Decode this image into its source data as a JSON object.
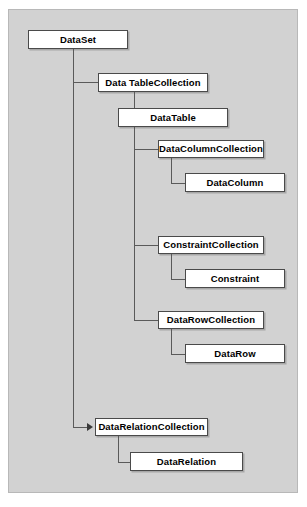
{
  "diagram": {
    "background_color": "#d2d2d2",
    "node_fill": "#ffffff",
    "node_border": "#4a4a4a",
    "connector_color": "#5a5a5a",
    "nodes": [
      {
        "id": "dataset",
        "label": "DataSet",
        "x": 28,
        "y": 30,
        "w": 100,
        "h": 19
      },
      {
        "id": "datatablecollection",
        "label": "Data TableCollection",
        "x": 98,
        "y": 73,
        "w": 110,
        "h": 19
      },
      {
        "id": "datatable",
        "label": "DataTable",
        "x": 118,
        "y": 108,
        "w": 110,
        "h": 19
      },
      {
        "id": "datacolumncollection",
        "label": "DataColumnCollection",
        "x": 158,
        "y": 140,
        "w": 106,
        "h": 18
      },
      {
        "id": "datacolumn",
        "label": "DataColumn",
        "x": 185,
        "y": 173,
        "w": 100,
        "h": 19
      },
      {
        "id": "constraintcollection",
        "label": "ConstraintCollection",
        "x": 158,
        "y": 236,
        "w": 106,
        "h": 18
      },
      {
        "id": "constraint",
        "label": "Constraint",
        "x": 185,
        "y": 269,
        "w": 100,
        "h": 19
      },
      {
        "id": "datarowcollection",
        "label": "DataRowCollection",
        "x": 158,
        "y": 311,
        "w": 106,
        "h": 18
      },
      {
        "id": "datarow",
        "label": "DataRow",
        "x": 185,
        "y": 344,
        "w": 100,
        "h": 19
      },
      {
        "id": "datarelationcollection",
        "label": "DataRelationCollection",
        "x": 95,
        "y": 418,
        "w": 113,
        "h": 18
      },
      {
        "id": "datarelation",
        "label": "DataRelation",
        "x": 130,
        "y": 452,
        "w": 113,
        "h": 19
      }
    ],
    "connectors": [
      {
        "id": "trunk-dataset",
        "type": "v",
        "x": 73,
        "y": 49,
        "len": 379
      },
      {
        "id": "dataset-to-dtc",
        "type": "h",
        "x": 73,
        "y": 82,
        "len": 25
      },
      {
        "id": "dataset-to-drc",
        "type": "h",
        "x": 73,
        "y": 427,
        "len": 15
      },
      {
        "id": "trunk-datatable",
        "type": "v",
        "x": 134,
        "y": 92,
        "len": 229
      },
      {
        "id": "dtc-to-dt",
        "type": "h",
        "x": 134,
        "y": 117,
        "len": 18
      },
      {
        "id": "dt-to-dcc",
        "type": "h",
        "x": 134,
        "y": 149,
        "len": 24
      },
      {
        "id": "dt-to-cc",
        "type": "h",
        "x": 134,
        "y": 245,
        "len": 24
      },
      {
        "id": "dt-to-drowc",
        "type": "h",
        "x": 134,
        "y": 320,
        "len": 24
      },
      {
        "id": "trunk-dcc",
        "type": "v",
        "x": 171,
        "y": 158,
        "len": 25
      },
      {
        "id": "dcc-to-dcol",
        "type": "h",
        "x": 171,
        "y": 183,
        "len": 18
      },
      {
        "id": "trunk-cc",
        "type": "v",
        "x": 171,
        "y": 254,
        "len": 25
      },
      {
        "id": "cc-to-c",
        "type": "h",
        "x": 171,
        "y": 279,
        "len": 18
      },
      {
        "id": "trunk-drowc",
        "type": "v",
        "x": 171,
        "y": 329,
        "len": 25
      },
      {
        "id": "drowc-to-drow",
        "type": "h",
        "x": 171,
        "y": 354,
        "len": 18
      },
      {
        "id": "trunk-drc",
        "type": "v",
        "x": 118,
        "y": 436,
        "len": 26
      },
      {
        "id": "drc-to-dr",
        "type": "h",
        "x": 118,
        "y": 462,
        "len": 14
      }
    ],
    "arrows": [
      {
        "id": "arrow-to-datarelationcollection",
        "x": 87,
        "y": 423
      }
    ]
  }
}
